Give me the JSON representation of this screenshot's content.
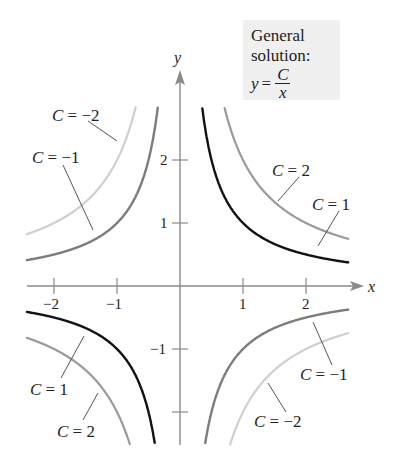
{
  "chart_data": {
    "type": "line",
    "xlabel": "x",
    "ylabel": "y",
    "xlim": [
      -2.45,
      2.9
    ],
    "ylim": [
      -2.55,
      2.95
    ],
    "grid": false,
    "x_ticks": [
      -2,
      -1,
      1,
      2
    ],
    "y_ticks": [
      -2,
      -1,
      1,
      2
    ],
    "x_tick_labels": [
      "−2",
      "−1",
      "1",
      "2"
    ],
    "y_tick_labels": [
      "",
      "−1",
      "1",
      "2"
    ],
    "series": [
      {
        "name": "C = 2",
        "C": 2,
        "color": "#9a9a9a",
        "width": 2.2
      },
      {
        "name": "C = 1",
        "C": 1,
        "color": "#111111",
        "width": 2.4
      },
      {
        "name": "C = −1",
        "C": -1,
        "color": "#7c7c7c",
        "width": 2.4
      },
      {
        "name": "C = −2",
        "C": -2,
        "color": "#cfcfcf",
        "width": 2.2
      }
    ],
    "annotations": [
      {
        "text": "C = −2",
        "quadrant": "upper-left"
      },
      {
        "text": "C = −1",
        "quadrant": "upper-left"
      },
      {
        "text": "C = 2",
        "quadrant": "upper-right"
      },
      {
        "text": "C = 1",
        "quadrant": "upper-right"
      },
      {
        "text": "C = 1",
        "quadrant": "lower-left"
      },
      {
        "text": "C = 2",
        "quadrant": "lower-left"
      },
      {
        "text": "C = −1",
        "quadrant": "lower-right"
      },
      {
        "text": "C = −2",
        "quadrant": "lower-right"
      }
    ]
  },
  "legend_box": {
    "line1": "General",
    "line2": "solution:",
    "lhs": "y",
    "equals": "=",
    "numerator": "C",
    "denominator": "x"
  },
  "axes": {
    "x_label": "x",
    "y_label": "y"
  },
  "labels": {
    "ul_cm2": {
      "pre": "C",
      "post": " = −2"
    },
    "ul_cm1": {
      "pre": "C",
      "post": " = −1"
    },
    "ur_c2": {
      "pre": "C",
      "post": " = 2"
    },
    "ur_c1": {
      "pre": "C",
      "post": " = 1"
    },
    "ll_c1": {
      "pre": "C",
      "post": " = 1"
    },
    "ll_c2": {
      "pre": "C",
      "post": " = 2"
    },
    "lr_cm1": {
      "pre": "C",
      "post": " = −1"
    },
    "lr_cm2": {
      "pre": "C",
      "post": " = −2"
    }
  }
}
